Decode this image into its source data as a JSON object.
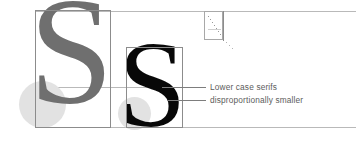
{
  "figure": {
    "background_color": "#ffffff"
  },
  "glyphs": {
    "capital": {
      "character": "S",
      "role": "capital-letter-specimen",
      "color": "#6f6f6f"
    },
    "lowercase": {
      "character": "S",
      "role": "lowercase-letter-specimen",
      "color": "#080808"
    },
    "inset": {
      "character": "s",
      "role": "thumbnail-detail-specimen"
    }
  },
  "callouts": [
    {
      "id": "callout-1",
      "text": "Lower case serifs"
    },
    {
      "id": "callout-2",
      "text": "disproportionally smaller"
    }
  ],
  "guides": {
    "cap_height_rule": "cap-height-guide",
    "x_height_rule": "x-height-guide",
    "baseline_rule": "baseline-guide",
    "line_color": "#b9b9b9",
    "box_color": "#8c8c8c",
    "highlight_color": "#e2e2e2"
  }
}
